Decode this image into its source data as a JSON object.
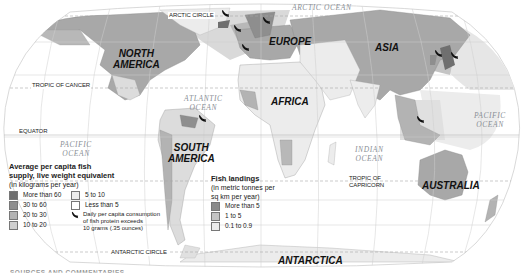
{
  "map": {
    "title": "Fish consumption and landings world map",
    "continents": [
      {
        "id": "north-america",
        "label_line1": "NORTH",
        "label_line2": "AMERICA"
      },
      {
        "id": "south-america",
        "label_line1": "SOUTH",
        "label_line2": "AMERICA"
      },
      {
        "id": "europe",
        "label_line1": "EUROPE",
        "label_line2": ""
      },
      {
        "id": "africa",
        "label_line1": "AFRICA",
        "label_line2": ""
      },
      {
        "id": "asia",
        "label_line1": "ASIA",
        "label_line2": ""
      },
      {
        "id": "australia",
        "label_line1": "AUSTRALIA",
        "label_line2": ""
      },
      {
        "id": "antarctica",
        "label_line1": "ANTARCTICA",
        "label_line2": ""
      }
    ],
    "oceans": {
      "arctic": "ARCTIC OCEAN",
      "atlantic_1": "ATLANTIC",
      "atlantic_2": "OCEAN",
      "pacific_w_1": "PACIFIC",
      "pacific_w_2": "OCEAN",
      "pacific_e_1": "PACIFIC",
      "pacific_e_2": "OCEAN",
      "indian_1": "INDIAN",
      "indian_2": "OCEAN"
    },
    "lines": {
      "arctic_circle": "ARCTIC CIRCLE",
      "tropic_cancer": "TROPIC OF CANCER",
      "equator": "EQUATOR",
      "tropic_capricorn_1": "TROPIC OF",
      "tropic_capricorn_2": "CAPRICORN",
      "antarctic_circle": "ANTARCTIC CIRCLE"
    },
    "colors": {
      "more_than_60": "#6f6f6f",
      "30_to_60": "#8e8e8e",
      "20_to_30": "#b3b3b3",
      "10_to_20": "#cfcfcf",
      "5_to_10": "#e6e6e6",
      "less_than_5": "#ffffff",
      "ocean_high": "#b8b8b8",
      "ocean_mid": "#d4d4d4",
      "ocean_low": "#ececec",
      "grid": "#c8c8c8"
    }
  },
  "legend_supply": {
    "title_line1": "Average per capita fish",
    "title_line2": "supply, live weight equivalent",
    "subtitle": "(in kilograms per year)",
    "items": [
      {
        "label": "More than 60",
        "color": "#6f6f6f"
      },
      {
        "label": "30 to 60",
        "color": "#8e8e8e"
      },
      {
        "label": "20 to 30",
        "color": "#b3b3b3"
      },
      {
        "label": "10 to 20",
        "color": "#cfcfcf"
      },
      {
        "label": "5 to 10",
        "color": "#ececec"
      },
      {
        "label": "Less than 5",
        "color": "#ffffff"
      }
    ],
    "fish_icon_line1": "Daily per capita consumption",
    "fish_icon_line2": "of fish protein exceeds",
    "fish_icon_line3": "10 grams (.35 ounces)"
  },
  "legend_landings": {
    "title": "Fish landings",
    "subtitle_line1": "(in metric tonnes per",
    "subtitle_line2": "sq km per year)",
    "items": [
      {
        "label": "More than 5",
        "color": "#8a8a8a"
      },
      {
        "label": "1 to 5",
        "color": "#c4c4c4"
      },
      {
        "label": "0.1 to 0.9",
        "color": "#ececec"
      }
    ]
  },
  "footer": {
    "cut_text": "SOURCES AND COMMENTARIES"
  }
}
